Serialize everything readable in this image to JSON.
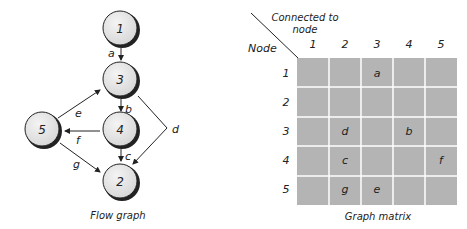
{
  "flow_graph": {
    "caption": "Flow graph",
    "nodes": [
      {
        "id": "1",
        "label": "1",
        "cx": 128,
        "cy": 30
      },
      {
        "id": "3",
        "label": "3",
        "cx": 128,
        "cy": 80
      },
      {
        "id": "4",
        "label": "4",
        "cx": 128,
        "cy": 130
      },
      {
        "id": "5",
        "label": "5",
        "cx": 47,
        "cy": 130
      },
      {
        "id": "2",
        "label": "2",
        "cx": 128,
        "cy": 181
      }
    ],
    "edges": [
      {
        "label": "a",
        "from": "1",
        "to": "3"
      },
      {
        "label": "b",
        "from": "3",
        "to": "4"
      },
      {
        "label": "c",
        "from": "4",
        "to": "2"
      },
      {
        "label": "d",
        "from": "3",
        "to": "2"
      },
      {
        "label": "e",
        "from": "5",
        "to": "3"
      },
      {
        "label": "f",
        "from": "4",
        "to": "5"
      },
      {
        "label": "g",
        "from": "5",
        "to": "2"
      }
    ]
  },
  "graph_matrix": {
    "caption": "Graph matrix",
    "row_header": "Node",
    "column_header_line1": "Connected to",
    "column_header_line2": "node",
    "columns": [
      "1",
      "2",
      "3",
      "4",
      "5"
    ],
    "rows": [
      {
        "node": "1",
        "cells": [
          "",
          "",
          "a",
          "",
          ""
        ]
      },
      {
        "node": "2",
        "cells": [
          "",
          "",
          "",
          "",
          ""
        ]
      },
      {
        "node": "3",
        "cells": [
          "",
          "d",
          "",
          "b",
          ""
        ]
      },
      {
        "node": "4",
        "cells": [
          "",
          "c",
          "",
          "",
          "f"
        ]
      },
      {
        "node": "5",
        "cells": [
          "",
          "g",
          "e",
          "",
          ""
        ]
      }
    ],
    "cell_color": "#b4b4b4",
    "grid_line_color": "#ffffff"
  }
}
